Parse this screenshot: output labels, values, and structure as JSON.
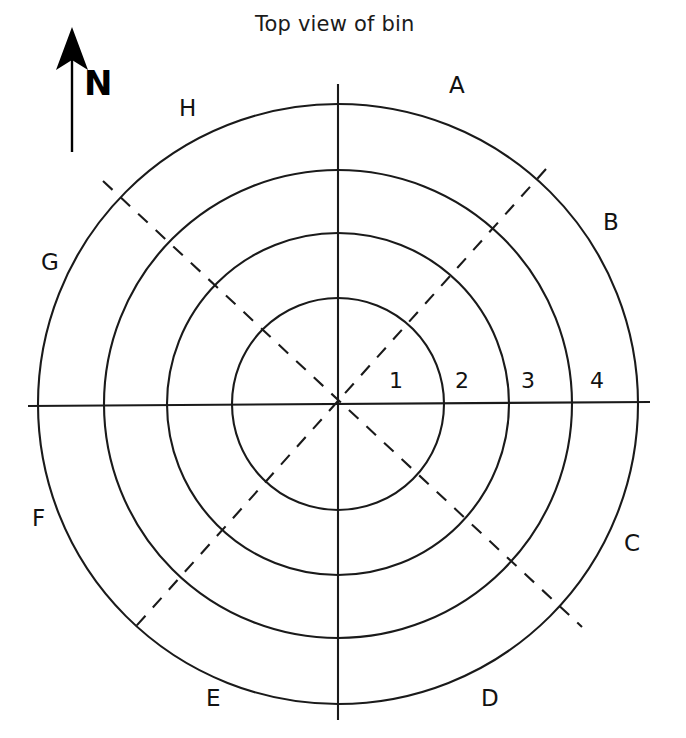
{
  "figure": {
    "title": "Top view of bin",
    "north_indicator": {
      "label": "N",
      "icon": "north-arrow-icon"
    }
  },
  "diagram": {
    "type": "polar-sector-map",
    "center": {
      "x": 338,
      "y": 404
    },
    "ring_radii": [
      106,
      171,
      234,
      300
    ],
    "sector_count": 8,
    "ring_count": 4,
    "stroke_color": "#1a1a1a",
    "background_color": "#ffffff",
    "sector_labels": [
      {
        "id": "A",
        "label": "A",
        "x": 455,
        "y": 85
      },
      {
        "id": "B",
        "label": "B",
        "x": 609,
        "y": 222
      },
      {
        "id": "C",
        "label": "C",
        "x": 630,
        "y": 543
      },
      {
        "id": "D",
        "label": "D",
        "x": 487,
        "y": 698
      },
      {
        "id": "E",
        "label": "E",
        "x": 212,
        "y": 698
      },
      {
        "id": "F",
        "label": "F",
        "x": 38,
        "y": 518
      },
      {
        "id": "G",
        "label": "G",
        "x": 49,
        "y": 262
      },
      {
        "id": "H",
        "label": "H",
        "x": 186,
        "y": 108
      }
    ],
    "ring_labels": [
      {
        "id": "1",
        "label": "1",
        "x": 395,
        "y": 381
      },
      {
        "id": "2",
        "label": "2",
        "x": 461,
        "y": 381
      },
      {
        "id": "3",
        "label": "3",
        "x": 527,
        "y": 381
      },
      {
        "id": "4",
        "label": "4",
        "x": 596,
        "y": 381
      }
    ],
    "axes": {
      "solid": [
        {
          "name": "vertical-axis",
          "style": "solid"
        },
        {
          "name": "horizontal-axis",
          "style": "solid"
        }
      ],
      "dashed": [
        {
          "name": "diagonal-axis-ne-sw",
          "style": "dashed"
        },
        {
          "name": "diagonal-axis-nw-se",
          "style": "dashed"
        }
      ]
    }
  }
}
